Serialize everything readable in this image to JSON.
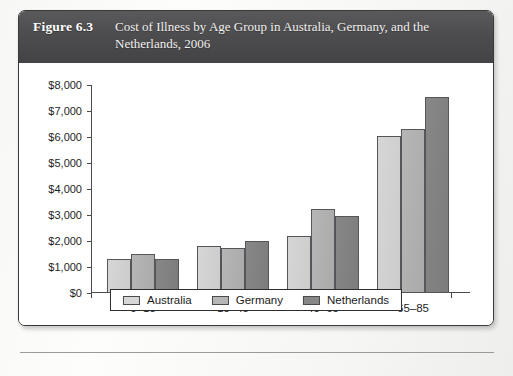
{
  "figure": {
    "number_label": "Figure 6.3",
    "title": "Cost of Illness by Age Group in Australia, Germany, and the Netherlands, 2006"
  },
  "colors": {
    "banner_background": "#4d4c4e",
    "banner_text": "#ffffff",
    "series_australia": "#d6d6d6",
    "series_germany": "#b6b6b6",
    "series_netherlands": "#878787",
    "axis": "#4a4a4a",
    "figure_border": "#3a3a3a"
  },
  "chart_data": {
    "type": "bar",
    "title": "Cost of Illness by Age Group in Australia, Germany, and the Netherlands, 2006",
    "xlabel": "",
    "ylabel": "",
    "categories": [
      "0–15",
      "15–45",
      "45–65",
      "65–85"
    ],
    "series": [
      {
        "name": "Australia",
        "values": [
          1300,
          1800,
          2200,
          6050
        ]
      },
      {
        "name": "Germany",
        "values": [
          1500,
          1750,
          3250,
          6300
        ]
      },
      {
        "name": "Netherlands",
        "values": [
          1300,
          2000,
          2950,
          7550
        ]
      }
    ],
    "ylim": [
      0,
      8000
    ],
    "ytick_values": [
      0,
      1000,
      2000,
      3000,
      4000,
      5000,
      6000,
      7000,
      8000
    ],
    "ytick_labels": [
      "$0",
      "$1,000",
      "$2,000",
      "$3,000",
      "$4,000",
      "$5,000",
      "$6,000",
      "$7,000",
      "$8,000"
    ],
    "grid": false,
    "legend_position": "bottom",
    "legend_entries": [
      "Australia",
      "Germany",
      "Netherlands"
    ]
  }
}
